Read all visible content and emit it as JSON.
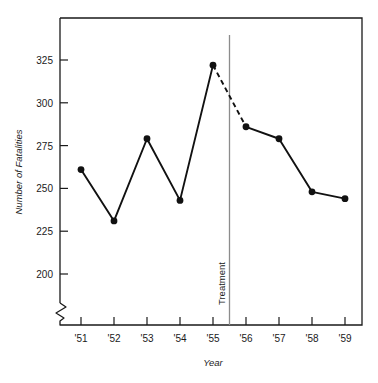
{
  "chart_data": {
    "type": "line",
    "title": "",
    "subtitle": "",
    "xlabel": "Year",
    "ylabel": "Number of Fatalities",
    "categories": [
      "'51",
      "'52",
      "'53",
      "'54",
      "'55",
      "'56",
      "'57",
      "'58",
      "'59"
    ],
    "x": [
      1951,
      1952,
      1953,
      1954,
      1955,
      1956,
      1957,
      1958,
      1959
    ],
    "values": [
      261,
      231,
      279,
      243,
      322,
      286,
      279,
      248,
      244
    ],
    "series": [
      {
        "name": "Number of Fatalities",
        "values": [
          261,
          231,
          279,
          243,
          322,
          286,
          279,
          248,
          244
        ]
      }
    ],
    "segments": [
      {
        "name": "pre-treatment",
        "style": "solid",
        "categories": [
          "'51",
          "'52",
          "'53",
          "'54",
          "'55"
        ],
        "values": [
          261,
          231,
          279,
          243,
          322
        ]
      },
      {
        "name": "interruption",
        "style": "dashed",
        "categories": [
          "'55",
          "'56"
        ],
        "values": [
          322,
          286
        ]
      },
      {
        "name": "post-treatment",
        "style": "solid",
        "categories": [
          "'56",
          "'57",
          "'58",
          "'59"
        ],
        "values": [
          286,
          279,
          248,
          244
        ]
      }
    ],
    "ytick_labels": [
      "325",
      "300",
      "275",
      "250",
      "225",
      "200"
    ],
    "yticks": [
      325,
      300,
      275,
      250,
      225,
      200
    ],
    "ylim": [
      190,
      340
    ],
    "xlim": [
      "'50.5",
      "'59.5"
    ],
    "axis_break": true,
    "grid": false,
    "legend": "none",
    "annotations": [
      {
        "name": "treatment-line",
        "label": "Treatment",
        "x_position": "between '55 and '56",
        "orientation": "vertical",
        "color": "#8c8c8c"
      }
    ],
    "colors": {
      "line": "#111111",
      "marker": "#111111",
      "axis": "#1a1a1a",
      "annotation_line": "#8c8c8c",
      "background": "#ffffff"
    }
  },
  "axes": {
    "y_title": "Number of Fatalities",
    "x_title": "Year",
    "y_tick_labels": [
      "325",
      "300",
      "275",
      "250",
      "225",
      "200"
    ],
    "x_tick_labels": [
      "'51",
      "'52",
      "'53",
      "'54",
      "'55",
      "'56",
      "'57",
      "'58",
      "'59"
    ]
  },
  "annotation": {
    "treatment_label": "Treatment"
  }
}
